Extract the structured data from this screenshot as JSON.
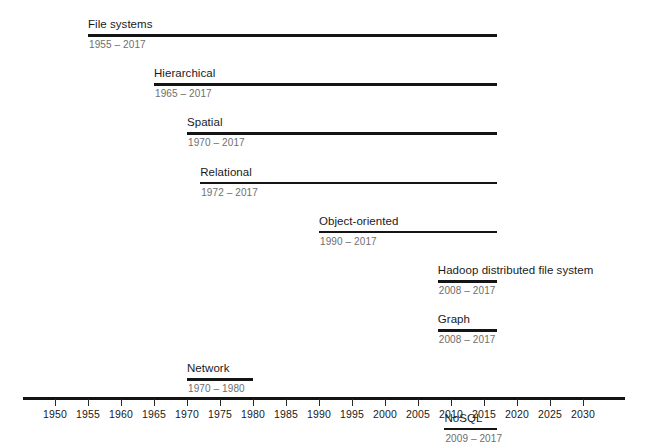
{
  "chart_data": {
    "type": "bar",
    "title": "",
    "subtitle": "",
    "xlabel": "",
    "ylabel": "",
    "orientation": "horizontal",
    "xlim": [
      1948,
      2033
    ],
    "grid": false,
    "legend": null,
    "axis": {
      "ticks": [
        1950,
        1955,
        1960,
        1965,
        1970,
        1975,
        1980,
        1985,
        1990,
        1995,
        2000,
        2005,
        2010,
        2015,
        2020,
        2025,
        2030
      ],
      "tick_labels": [
        "1950",
        "1955",
        "1960",
        "1965",
        "1970",
        "1975",
        "1980",
        "1985",
        "1990",
        "1995",
        "2000",
        "2005",
        "2010",
        "2015",
        "2020",
        "2025",
        "2030"
      ],
      "tick_step": 5,
      "min": 1950,
      "max": 2030
    },
    "categories": [
      "File systems",
      "Hierarchical",
      "Spatial",
      "Relational",
      "Object-oriented",
      "Hadoop distributed file system",
      "Graph",
      "Network",
      "NoSQL"
    ],
    "bars": [
      {
        "label": "File systems",
        "start": 1955,
        "end": 2017,
        "range_text": "1955 – 2017",
        "duration": 62
      },
      {
        "label": "Hierarchical",
        "start": 1965,
        "end": 2017,
        "range_text": "1965 – 2017",
        "duration": 52
      },
      {
        "label": "Spatial",
        "start": 1970,
        "end": 2017,
        "range_text": "1970 – 2017",
        "duration": 47
      },
      {
        "label": "Relational",
        "start": 1972,
        "end": 2017,
        "range_text": "1972 – 2017",
        "duration": 45
      },
      {
        "label": "Object-oriented",
        "start": 1990,
        "end": 2017,
        "range_text": "1990 – 2017",
        "duration": 27
      },
      {
        "label": "Hadoop distributed file system",
        "start": 2008,
        "end": 2017,
        "range_text": "2008 – 2017",
        "duration": 9
      },
      {
        "label": "Graph",
        "start": 2008,
        "end": 2017,
        "range_text": "2008 – 2017",
        "duration": 9
      },
      {
        "label": "Network",
        "start": 1970,
        "end": 1980,
        "range_text": "1970 – 1980",
        "duration": 10
      },
      {
        "label": "NoSQL",
        "start": 2009,
        "end": 2017,
        "range_text": "2009 – 2017",
        "duration": 8
      }
    ],
    "colors": {
      "bar": "#141414",
      "label_text": "#1a1a1a",
      "range_text": "#6e6e6e",
      "axis": "#141414",
      "background": "#ffffff"
    }
  }
}
